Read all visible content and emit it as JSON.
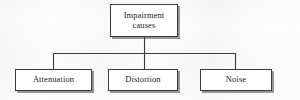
{
  "diagram": {
    "title": "Impairment causes",
    "type": "tree",
    "orientation": "top-down",
    "background_color": "#fdfdfd",
    "line_color": "#3a3a3a",
    "text_color": "#1b1b1b",
    "shadow_color": "#464646",
    "root": {
      "id": "root",
      "label": "Impairment\ncauses",
      "label_line1": "Impairment",
      "label_line2": "causes"
    },
    "children": [
      {
        "id": "attenuation",
        "label": "Attenuation"
      },
      {
        "id": "distortion",
        "label": "Distortion"
      },
      {
        "id": "noise",
        "label": "Noise"
      }
    ]
  }
}
